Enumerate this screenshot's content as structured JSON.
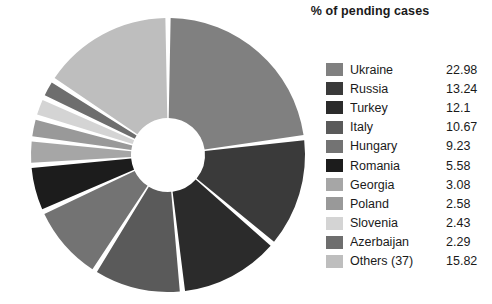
{
  "chart_data": {
    "type": "pie",
    "title": "% of pending cases",
    "variant": "doughnut",
    "start_angle_deg": 0,
    "direction": "clockwise",
    "gap_deg": 2.2,
    "grid": false,
    "legend_position": "right",
    "xlabel": "",
    "ylabel": "",
    "units": "%",
    "categories": [
      "Ukraine",
      "Russia",
      "Turkey",
      "Italy",
      "Hungary",
      "Romania",
      "Georgia",
      "Poland",
      "Slovenia",
      "Azerbaijan",
      "Others (37)"
    ],
    "values": [
      22.98,
      13.24,
      12.1,
      10.67,
      9.23,
      5.58,
      3.08,
      2.58,
      2.43,
      2.29,
      15.82
    ],
    "colors": [
      "#808080",
      "#3a3a3a",
      "#2b2b2b",
      "#5a5a5a",
      "#737373",
      "#1c1c1c",
      "#a6a6a6",
      "#999999",
      "#d4d4d4",
      "#6e6e6e",
      "#bebebe"
    ],
    "slices": [
      {
        "label": "Ukraine",
        "value": 22.98,
        "value_text": "22.98",
        "color": "#808080"
      },
      {
        "label": "Russia",
        "value": 13.24,
        "value_text": "13.24",
        "color": "#3a3a3a"
      },
      {
        "label": "Turkey",
        "value": 12.1,
        "value_text": "12.1",
        "color": "#2b2b2b"
      },
      {
        "label": "Italy",
        "value": 10.67,
        "value_text": "10.67",
        "color": "#5a5a5a"
      },
      {
        "label": "Hungary",
        "value": 9.23,
        "value_text": "9.23",
        "color": "#737373"
      },
      {
        "label": "Romania",
        "value": 5.58,
        "value_text": "5.58",
        "color": "#1c1c1c"
      },
      {
        "label": "Georgia",
        "value": 3.08,
        "value_text": "3.08",
        "color": "#a6a6a6"
      },
      {
        "label": "Poland",
        "value": 2.58,
        "value_text": "2.58",
        "color": "#999999"
      },
      {
        "label": "Slovenia",
        "value": 2.43,
        "value_text": "2.43",
        "color": "#d4d4d4"
      },
      {
        "label": "Azerbaijan",
        "value": 2.29,
        "value_text": "2.29",
        "color": "#6e6e6e"
      },
      {
        "label": "Others (37)",
        "value": 15.82,
        "value_text": "15.82",
        "color": "#bebebe"
      }
    ]
  },
  "geometry": {
    "cx": 168,
    "cy": 155,
    "outer_radius": 137,
    "inner_radius": 37,
    "background": "#ffffff"
  }
}
